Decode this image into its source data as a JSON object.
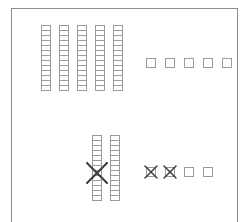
{
  "figure": {
    "title": "Base-ten blocks subtraction diagram",
    "background_color": "#ffffff",
    "frame_color": "#8c8c8c",
    "block_stroke_color": "#9a9a9a",
    "mark_color": "#3a3a3a",
    "frame": {
      "x": 11,
      "y": 8,
      "width": 227,
      "height": 214
    }
  },
  "groups": [
    {
      "id": "top-left-rods",
      "label": "Top left tens rods",
      "type": "rod-group",
      "rod_count": 5,
      "cells_per_rod": 13,
      "crossed_out": 0,
      "origin": {
        "x": 41,
        "y": 25
      },
      "pitch_x": 18,
      "cell": {
        "width": 10,
        "height": 6
      }
    },
    {
      "id": "top-right-units",
      "label": "Top right unit squares",
      "type": "unit-group",
      "unit_count": 5,
      "crossed_out": 0,
      "origin": {
        "x": 146,
        "y": 58
      },
      "pitch_x": 19,
      "cell": {
        "width": 10,
        "height": 10
      }
    },
    {
      "id": "bottom-left-rods",
      "label": "Bottom left tens rods",
      "type": "rod-group",
      "rod_count": 2,
      "cells_per_rod": 13,
      "crossed_out": 1,
      "origin": {
        "x": 92,
        "y": 135
      },
      "pitch_x": 18,
      "cell": {
        "width": 10,
        "height": 6
      }
    },
    {
      "id": "bottom-right-units",
      "label": "Bottom right unit squares",
      "type": "unit-group",
      "unit_count": 4,
      "crossed_out": 2,
      "origin": {
        "x": 146,
        "y": 167
      },
      "pitch_x": 19,
      "cell": {
        "width": 10,
        "height": 10
      }
    }
  ],
  "marks": [
    {
      "id": "rod-cross-out",
      "label": "Large X crossing out first bottom-left rod",
      "shape": "x",
      "x": 86,
      "y": 162,
      "width": 22,
      "height": 22,
      "stroke_width": 2
    },
    {
      "id": "unit-cross-out-1",
      "label": "X crossing out first bottom-right unit",
      "shape": "x",
      "x": 144,
      "y": 165,
      "width": 14,
      "height": 14,
      "stroke_width": 1.4
    },
    {
      "id": "unit-cross-out-2",
      "label": "X crossing out second bottom-right unit",
      "shape": "x",
      "x": 163,
      "y": 165,
      "width": 14,
      "height": 14,
      "stroke_width": 1.4
    }
  ]
}
